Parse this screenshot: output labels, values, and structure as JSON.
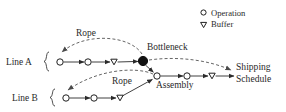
{
  "diagram": {
    "background": "#ffffff",
    "ink": "#2b2b2b"
  },
  "legend": {
    "items": [
      {
        "glyph": "circle",
        "glyph_name": "operation-icon",
        "label": "Operation"
      },
      {
        "glyph": "triangle-down",
        "glyph_name": "buffer-icon",
        "label": "Buffer"
      }
    ]
  },
  "labels": {
    "line_a": "Line A",
    "line_b": "Line B",
    "bottleneck": "Bottleneck",
    "assembly": "Assembly",
    "rope_top": "Rope",
    "rope_bottom": "Rope",
    "shipping_line1": "Shipping",
    "shipping_line2": "Schedule"
  },
  "nodes": [
    {
      "id": "a1",
      "type": "operation",
      "line": "Line A",
      "x": 60,
      "y": 62
    },
    {
      "id": "a2",
      "type": "operation",
      "line": "Line A",
      "x": 88,
      "y": 62
    },
    {
      "id": "a3",
      "type": "buffer",
      "line": "Line A",
      "x": 114,
      "y": 62
    },
    {
      "id": "bn",
      "type": "bottleneck",
      "line": "Line A",
      "x": 143,
      "y": 61
    },
    {
      "id": "b1",
      "type": "operation",
      "line": "Line B",
      "x": 66,
      "y": 98
    },
    {
      "id": "b2",
      "type": "operation",
      "line": "Line B",
      "x": 94,
      "y": 98
    },
    {
      "id": "b3",
      "type": "buffer",
      "line": "Line B",
      "x": 120,
      "y": 98
    },
    {
      "id": "as",
      "type": "operation",
      "line": "Assembly",
      "x": 157,
      "y": 76
    },
    {
      "id": "s1",
      "type": "operation",
      "line": "Assembly",
      "x": 187,
      "y": 76
    },
    {
      "id": "s2",
      "type": "buffer",
      "line": "Assembly",
      "x": 212,
      "y": 76
    }
  ],
  "edges": [
    {
      "from": "a1",
      "to": "a2",
      "style": "solid"
    },
    {
      "from": "a2",
      "to": "a3",
      "style": "solid"
    },
    {
      "from": "a3",
      "to": "bn",
      "style": "solid"
    },
    {
      "from": "bn",
      "to": "as",
      "style": "solid"
    },
    {
      "from": "b1",
      "to": "b2",
      "style": "solid"
    },
    {
      "from": "b2",
      "to": "b3",
      "style": "solid"
    },
    {
      "from": "b3",
      "to": "as",
      "style": "solid"
    },
    {
      "from": "as",
      "to": "s1",
      "style": "solid"
    },
    {
      "from": "s1",
      "to": "s2",
      "style": "solid"
    },
    {
      "from": "s2",
      "to": "shipping",
      "style": "solid"
    },
    {
      "from": "bn",
      "to": "a1",
      "style": "dashed",
      "label": "Rope"
    },
    {
      "from": "as",
      "to": "b1",
      "style": "dashed",
      "label": "Rope"
    },
    {
      "from": "shipping",
      "to": "bn",
      "style": "dashed"
    }
  ]
}
